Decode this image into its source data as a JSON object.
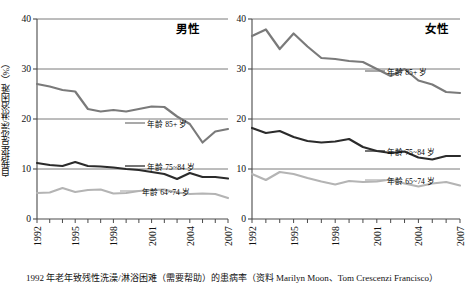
{
  "figure": {
    "ylabel": "自我报告洗澡/淋浴困难（%）",
    "caption": "1992 年老年致残性洗澡/淋浴困难（需要帮助）的患病率（资料 Marilyn Moon、Tom Crescenzi Francisco）"
  },
  "panels": [
    {
      "id": "male",
      "title": "男性",
      "yticks": [
        "0",
        "10",
        "20",
        "30",
        "40"
      ],
      "xticks": [
        "1992",
        "1995",
        "1998",
        "2001",
        "2004",
        "2007"
      ],
      "series_labels": [
        {
          "text": "年龄 85+ 岁",
          "key": "age85"
        },
        {
          "text": "年龄 75~84 岁",
          "key": "age7584"
        },
        {
          "text": "年龄 64~74 岁",
          "key": "age6474"
        }
      ]
    },
    {
      "id": "female",
      "title": "女性",
      "yticks": [
        "0",
        "10",
        "20",
        "30",
        "40"
      ],
      "xticks": [
        "1992",
        "1995",
        "1998",
        "2001",
        "2004",
        "2007"
      ],
      "series_labels": [
        {
          "text": "年龄 85+ 岁",
          "key": "age85"
        },
        {
          "text": "年龄 75~84 岁",
          "key": "age7584"
        },
        {
          "text": "年龄 65~74 岁",
          "key": "age6574"
        }
      ]
    }
  ],
  "chart_data": [
    {
      "type": "line",
      "title": "男性",
      "xlabel": "",
      "ylabel": "自我报告洗澡/淋浴困难（%）",
      "x": [
        1992,
        1993,
        1994,
        1995,
        1996,
        1997,
        1998,
        1999,
        2000,
        2001,
        2002,
        2003,
        2004,
        2005,
        2006,
        2007
      ],
      "xlim": [
        1992,
        2007
      ],
      "ylim": [
        0,
        40
      ],
      "yticks": [
        0,
        10,
        20,
        30,
        40
      ],
      "grid": "horizontal",
      "legend_position": "inline-right",
      "series": [
        {
          "name": "年龄 85+ 岁",
          "color": "#7a7a7a",
          "width": 2.2,
          "values": [
            27.0,
            26.5,
            25.8,
            25.5,
            22.0,
            21.5,
            21.8,
            21.5,
            22.0,
            22.5,
            22.4,
            20.5,
            19.0,
            15.3,
            17.5,
            18.0
          ]
        },
        {
          "name": "年龄 75~84 岁",
          "color": "#2b2b2b",
          "width": 2.2,
          "values": [
            11.2,
            10.8,
            10.6,
            11.4,
            10.6,
            10.5,
            10.3,
            10.0,
            9.8,
            9.4,
            9.0,
            8.0,
            9.2,
            8.4,
            8.4,
            8.1
          ]
        },
        {
          "name": "年龄 64~74 岁",
          "color": "#b4b4b4",
          "width": 2.2,
          "values": [
            5.2,
            5.3,
            6.2,
            5.4,
            5.8,
            5.9,
            5.1,
            5.2,
            5.6,
            5.8,
            5.9,
            5.3,
            5.0,
            5.1,
            5.0,
            4.2
          ]
        }
      ]
    },
    {
      "type": "line",
      "title": "女性",
      "xlabel": "",
      "ylabel": "自我报告洗澡/淋浴困难（%）",
      "x": [
        1992,
        1993,
        1994,
        1995,
        1996,
        1997,
        1998,
        1999,
        2000,
        2001,
        2002,
        2003,
        2004,
        2005,
        2006,
        2007
      ],
      "xlim": [
        1992,
        2007
      ],
      "ylim": [
        0,
        40
      ],
      "yticks": [
        0,
        10,
        20,
        30,
        40
      ],
      "grid": "horizontal",
      "legend_position": "inline-right",
      "series": [
        {
          "name": "年龄 85+ 岁",
          "color": "#7a7a7a",
          "width": 2.2,
          "values": [
            36.6,
            37.9,
            34.0,
            37.1,
            34.5,
            32.2,
            32.0,
            31.6,
            31.4,
            30.0,
            28.6,
            30.0,
            27.7,
            26.9,
            25.4,
            25.2
          ]
        },
        {
          "name": "年龄 75~84 岁",
          "color": "#2b2b2b",
          "width": 2.2,
          "values": [
            18.2,
            17.2,
            17.6,
            16.4,
            15.6,
            15.3,
            15.5,
            16.0,
            14.4,
            13.6,
            13.2,
            13.5,
            12.3,
            11.9,
            12.6,
            12.6
          ]
        },
        {
          "name": "年龄 65~74 岁",
          "color": "#b4b4b4",
          "width": 2.2,
          "values": [
            9.0,
            7.8,
            9.4,
            9.0,
            8.2,
            7.5,
            6.9,
            7.6,
            7.4,
            7.5,
            7.9,
            7.1,
            6.5,
            7.1,
            7.4,
            6.7
          ]
        }
      ]
    }
  ]
}
